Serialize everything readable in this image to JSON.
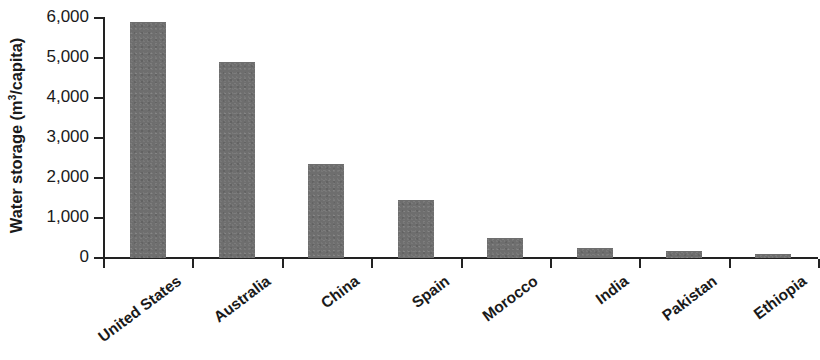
{
  "chart_data": {
    "type": "bar",
    "title": "",
    "xlabel": "",
    "ylabel": "Water storage (m3/capita)",
    "ylabel_prefix": "Water storage (m",
    "ylabel_sup": "3",
    "ylabel_suffix": "/capita)",
    "categories": [
      "United States",
      "Australia",
      "China",
      "Spain",
      "Morocco",
      "India",
      "Pakistan",
      "Ethiopia"
    ],
    "values": [
      5900,
      4900,
      2350,
      1450,
      500,
      250,
      180,
      100
    ],
    "ylim": [
      0,
      6000
    ],
    "ytick_values": [
      6000,
      5000,
      4000,
      3000,
      2000,
      1000,
      0
    ],
    "ytick_labels": [
      "6,000",
      "5,000",
      "4,000",
      "3,000",
      "2,000",
      "1,000",
      "0"
    ],
    "grid": false,
    "legend": false,
    "bar_color": "#6e6e6e",
    "axis_color": "#222222",
    "label_rotation": -37
  }
}
